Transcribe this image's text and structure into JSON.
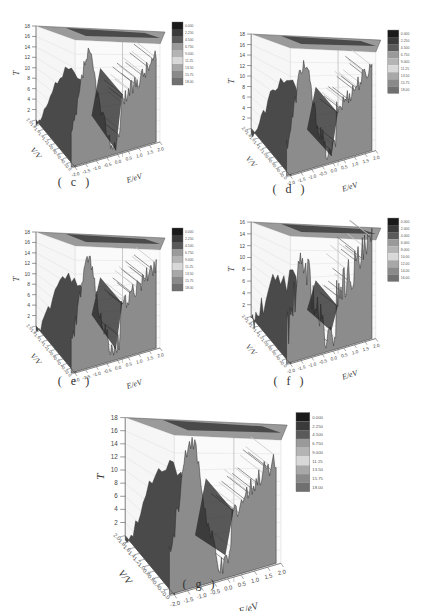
{
  "figure": {
    "panels": [
      {
        "id": "c",
        "caption": "( c )",
        "x": 0,
        "y": 12,
        "w": 215,
        "h": 190,
        "cx": 75,
        "cy": 183,
        "variant": 0
      },
      {
        "id": "d",
        "caption": "( d )",
        "x": 215,
        "y": 20,
        "w": 216,
        "h": 182,
        "cx": 290,
        "cy": 190,
        "variant": 1
      },
      {
        "id": "e",
        "caption": "( e )",
        "x": 0,
        "y": 218,
        "w": 215,
        "h": 180,
        "cx": 75,
        "cy": 382,
        "variant": 2
      },
      {
        "id": "f",
        "caption": "( f )",
        "x": 215,
        "y": 208,
        "w": 216,
        "h": 190,
        "cx": 290,
        "cy": 382,
        "variant": 3
      },
      {
        "id": "g",
        "caption": "( g )",
        "x": 80,
        "y": 400,
        "w": 270,
        "h": 180,
        "cx": 200,
        "cy": 585,
        "variant": 4
      }
    ]
  },
  "chart_data": [
    {
      "panel": "c",
      "type": "surface3d",
      "title": "",
      "zlabel": "T",
      "xlabel": "E/eV",
      "ylabel": "V/V",
      "zlim": [
        0,
        18
      ],
      "xlim": [
        -2.0,
        2.0
      ],
      "ylim": [
        0.0,
        2.0
      ],
      "z_ticks": [
        "2",
        "4",
        "6",
        "8",
        "10",
        "12",
        "14",
        "16",
        "18"
      ],
      "x_ticks": [
        "-2.0",
        "-1.5",
        "-1.0",
        "-0.5",
        "0.0",
        "0.5",
        "1.0",
        "1.5",
        "2.0"
      ],
      "y_ticks": [
        "0.0",
        "0.2",
        "0.4",
        "0.6",
        "0.8",
        "1.0",
        "1.2",
        "1.4",
        "1.6",
        "1.8",
        "2.0"
      ],
      "colorbar": [
        "0.000",
        "2.250",
        "4.500",
        "6.750",
        "9.000",
        "11.25",
        "13.50",
        "15.75",
        "18.00"
      ],
      "description": "Transmission surface with high ridge near E=-1.5..-1.0 (T~12-14), deep valley near E=0 (T~0), plateau rising to T~12 at E=2.0"
    },
    {
      "panel": "d",
      "type": "surface3d",
      "zlabel": "T",
      "xlabel": "E/eV",
      "ylabel": "V/V",
      "zlim": [
        0,
        18
      ],
      "xlim": [
        -2.0,
        2.0
      ],
      "ylim": [
        0.0,
        2.0
      ],
      "z_ticks": [
        "2",
        "4",
        "6",
        "8",
        "10",
        "12",
        "14",
        "16",
        "18"
      ],
      "x_ticks": [
        "-2.0",
        "-1.5",
        "-1.0",
        "-0.5",
        "0.0",
        "0.5",
        "1.0",
        "1.5",
        "2.0"
      ],
      "colorbar": [
        "0.000",
        "2.250",
        "4.500",
        "6.750",
        "9.000",
        "11.25",
        "13.50",
        "15.75",
        "18.00"
      ],
      "description": "Similar to (c): ridge T~12 near E=-1.2, valley near E=0, rising to T~13 at E=2.0"
    },
    {
      "panel": "e",
      "type": "surface3d",
      "zlabel": "T",
      "xlabel": "E/eV",
      "ylabel": "V/V",
      "zlim": [
        0,
        18
      ],
      "xlim": [
        -2.0,
        2.0
      ],
      "ylim": [
        0.0,
        2.0
      ],
      "z_ticks": [
        "2",
        "4",
        "6",
        "8",
        "10",
        "12",
        "14",
        "16",
        "18"
      ],
      "x_ticks": [
        "-2.0",
        "-1.5",
        "-1.0",
        "-0.5",
        "0.0",
        "0.5",
        "1.0",
        "1.5",
        "2.0"
      ],
      "colorbar": [
        "0.000",
        "2.250",
        "4.500",
        "6.750",
        "9.000",
        "11.25",
        "13.50",
        "15.75",
        "18.00"
      ],
      "description": "Ridge T~12 near E=-1.2, valley near E=-0.2, rising to T~13 at E=2.0"
    },
    {
      "panel": "f",
      "type": "surface3d",
      "zlabel": "T",
      "xlabel": "E/eV",
      "ylabel": "V/V",
      "zlim": [
        0,
        16
      ],
      "xlim": [
        -2.0,
        2.0
      ],
      "ylim": [
        0.0,
        2.0
      ],
      "z_ticks": [
        "2",
        "4",
        "6",
        "8",
        "10",
        "12",
        "14",
        "16"
      ],
      "x_ticks": [
        "-2.0",
        "-1.5",
        "-1.0",
        "-0.5",
        "0.0",
        "0.5",
        "1.0",
        "1.5",
        "2.0"
      ],
      "colorbar": [
        "0.000",
        "2.000",
        "4.000",
        "6.000",
        "8.000",
        "10.00",
        "12.00",
        "14.00",
        "16.00"
      ],
      "description": "Noisier transmission, peaks T~10-11 near E=-1.0, valley near E=0, plateau T~8-10 for E>0.5"
    },
    {
      "panel": "g",
      "type": "surface3d",
      "zlabel": "T",
      "xlabel": "E/eV",
      "ylabel": "V/V",
      "zlim": [
        0,
        18
      ],
      "xlim": [
        -2.0,
        2.0
      ],
      "ylim": [
        0.0,
        2.0
      ],
      "z_ticks": [
        "2",
        "4",
        "6",
        "8",
        "10",
        "12",
        "14",
        "16",
        "18"
      ],
      "x_ticks": [
        "-2.0",
        "-1.5",
        "-1.0",
        "-0.5",
        "0.0",
        "0.5",
        "1.0",
        "1.5",
        "2.0"
      ],
      "y_ticks": [
        "0.0",
        "0.2",
        "0.4",
        "0.6",
        "0.8",
        "1.0",
        "1.2",
        "1.4",
        "1.6",
        "1.8",
        "2.0"
      ],
      "colorbar": [
        "0.000",
        "2.250",
        "4.500",
        "6.750",
        "9.000",
        "11.25",
        "13.50",
        "15.75",
        "18.00"
      ],
      "description": "Sharp peak T~14 near E=-1.2, valley near E=0, plateau T~10-12 for E>0.5"
    }
  ],
  "colors": {
    "colorbar_bands": [
      "#1a1a1a",
      "#3a3a3a",
      "#5a5a5a",
      "#9a9a9a",
      "#b4b4b4",
      "#d8d8d8",
      "#a8a8a8",
      "#8a8a8a",
      "#707070"
    ],
    "surface_dark": "#3b3b3b",
    "surface_mid": "#8a8a8a",
    "surface_light": "#c8c8c8",
    "front_face": "#8c8c8c",
    "side_face": "#4a4a4a",
    "grid": "#d9d9d9",
    "axis": "#555555"
  }
}
